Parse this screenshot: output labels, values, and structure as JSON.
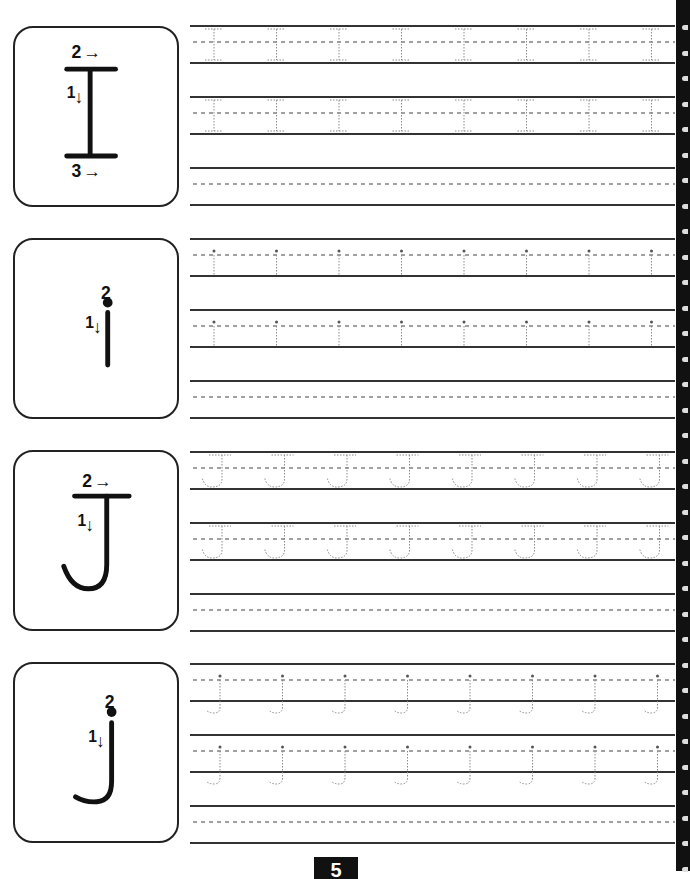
{
  "worksheet": {
    "page_number": "5",
    "sections": [
      {
        "letter": "I",
        "case": "uppercase",
        "stroke_order": [
          {
            "step": "1",
            "direction": "down"
          },
          {
            "step": "2",
            "direction": "right"
          },
          {
            "step": "3",
            "direction": "right"
          }
        ],
        "trace_rows": 2,
        "blank_rows": 1,
        "traces_per_row": 8
      },
      {
        "letter": "i",
        "case": "lowercase",
        "stroke_order": [
          {
            "step": "1",
            "direction": "down"
          },
          {
            "step": "2",
            "direction": "dot"
          }
        ],
        "trace_rows": 2,
        "blank_rows": 1,
        "traces_per_row": 8
      },
      {
        "letter": "J",
        "case": "uppercase",
        "stroke_order": [
          {
            "step": "1",
            "direction": "down"
          },
          {
            "step": "2",
            "direction": "right"
          }
        ],
        "trace_rows": 2,
        "blank_rows": 1,
        "traces_per_row": 8
      },
      {
        "letter": "j",
        "case": "lowercase",
        "stroke_order": [
          {
            "step": "1",
            "direction": "down"
          },
          {
            "step": "2",
            "direction": "dot"
          }
        ],
        "trace_rows": 2,
        "blank_rows": 1,
        "traces_per_row": 8
      }
    ],
    "labels": {
      "one": "1",
      "two": "2",
      "three": "3",
      "arrow_right": "→",
      "arrow_down": "↓"
    }
  }
}
